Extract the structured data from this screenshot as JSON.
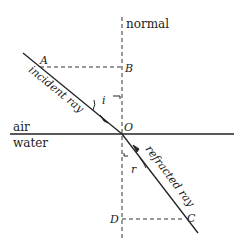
{
  "diagram": {
    "labels": {
      "normal": "normal",
      "air": "air",
      "water": "water",
      "incident_ray": "incident ray",
      "refracted_ray": "refracted ray",
      "point_A": "A",
      "point_B": "B",
      "point_O": "O",
      "point_C": "C",
      "point_D": "D",
      "angle_i": "i",
      "angle_r": "r"
    },
    "colors": {
      "line": "#222222",
      "background": "#ffffff"
    }
  }
}
